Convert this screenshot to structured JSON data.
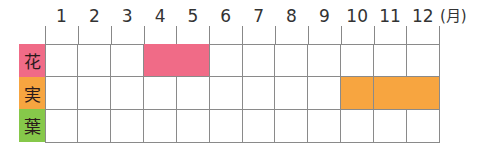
{
  "chart_data": {
    "type": "table",
    "title": "",
    "unit_label": "(月)",
    "categories": [
      "1",
      "2",
      "3",
      "4",
      "5",
      "6",
      "7",
      "8",
      "9",
      "10",
      "11",
      "12"
    ],
    "rows": [
      {
        "label": "花",
        "color": "#f06b87",
        "active_months": [
          4,
          5
        ]
      },
      {
        "label": "実",
        "color": "#f7a540",
        "active_months": [
          10,
          11,
          12
        ]
      },
      {
        "label": "葉",
        "color": "#86c84a",
        "active_months": []
      }
    ]
  }
}
